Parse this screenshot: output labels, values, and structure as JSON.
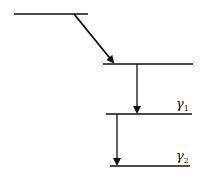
{
  "diagram": {
    "type": "energy-level-cascade",
    "levels": [
      {
        "id": "level-0",
        "label": ""
      },
      {
        "id": "level-1",
        "label": ""
      },
      {
        "id": "level-2",
        "label": "γ1",
        "symbol": "γ",
        "subscript": "1"
      },
      {
        "id": "level-3",
        "label": "γ2",
        "symbol": "γ",
        "subscript": "2"
      }
    ],
    "transitions": [
      {
        "from": "level-0",
        "to": "level-1",
        "style": "diagonal"
      },
      {
        "from": "level-1",
        "to": "level-2",
        "label": "γ1"
      },
      {
        "from": "level-2",
        "to": "level-3",
        "label": "γ2"
      }
    ],
    "colors": {
      "line": "#111111",
      "background": "#ffffff"
    }
  }
}
